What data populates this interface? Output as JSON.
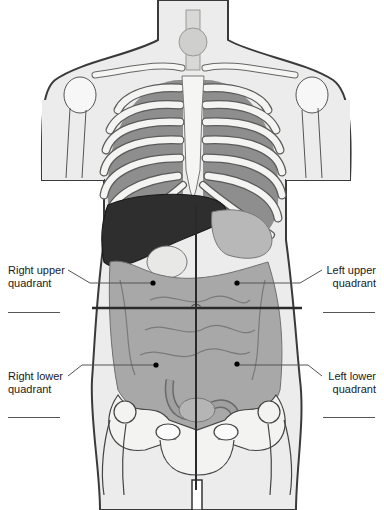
{
  "diagram": {
    "labels": {
      "right_upper": {
        "line1": "Right upper",
        "line2": "quadrant"
      },
      "left_upper": {
        "line1": "Left upper",
        "line2": "quadrant"
      },
      "right_lower": {
        "line1": "Right lower",
        "line2": "quadrant"
      },
      "left_lower": {
        "line1": "Left lower",
        "line2": "quadrant"
      }
    },
    "blank_answer_lines": 4,
    "colors": {
      "skin": "#ececec",
      "outline": "#3a3a3a",
      "bone": "#f4f4f2",
      "rib_shadow": "#9a9a9a",
      "liver": "#2e2e2e",
      "intestine": "#a8a8a8",
      "intestine_dark": "#8a8a8a",
      "quadrant_line": "#2a2a2a"
    }
  }
}
